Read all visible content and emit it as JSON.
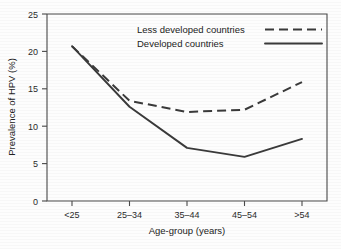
{
  "chart_data": {
    "type": "line",
    "title": "",
    "xlabel": "Age-group (years)",
    "ylabel": "Prevalence of HPV (%)",
    "categories": [
      "<25",
      "25–34",
      "35–44",
      "45–54",
      ">54"
    ],
    "ylim": [
      0,
      25
    ],
    "yticks": [
      0,
      5,
      10,
      15,
      20,
      25
    ],
    "ytick_labels": [
      "0",
      "5",
      "10",
      "15",
      "20",
      "25"
    ],
    "grid": false,
    "legend_position": "top-center",
    "series": [
      {
        "name": "Less developed countries",
        "style": "dashed",
        "color": "#3a3a3a",
        "values": [
          20.7,
          13.4,
          11.9,
          12.2,
          15.9
        ]
      },
      {
        "name": "Developed countries",
        "style": "solid",
        "color": "#3a3a3a",
        "values": [
          20.7,
          12.6,
          7.1,
          5.9,
          8.3
        ]
      }
    ]
  },
  "legend": {
    "entries": [
      {
        "label": "Less developed countries",
        "style": "dashed"
      },
      {
        "label": "Developed countries",
        "style": "solid"
      }
    ]
  },
  "axes": {
    "y_tick_0": "0",
    "y_tick_1": "5",
    "y_tick_2": "10",
    "y_tick_3": "15",
    "y_tick_4": "20",
    "y_tick_5": "25",
    "x_tick_0": "<25",
    "x_tick_1": "25–34",
    "x_tick_2": "35–44",
    "x_tick_3": "45–54",
    "x_tick_4": ">54",
    "x_title": "Age-group (years)",
    "y_title": "Prevalence of HPV (%)"
  }
}
